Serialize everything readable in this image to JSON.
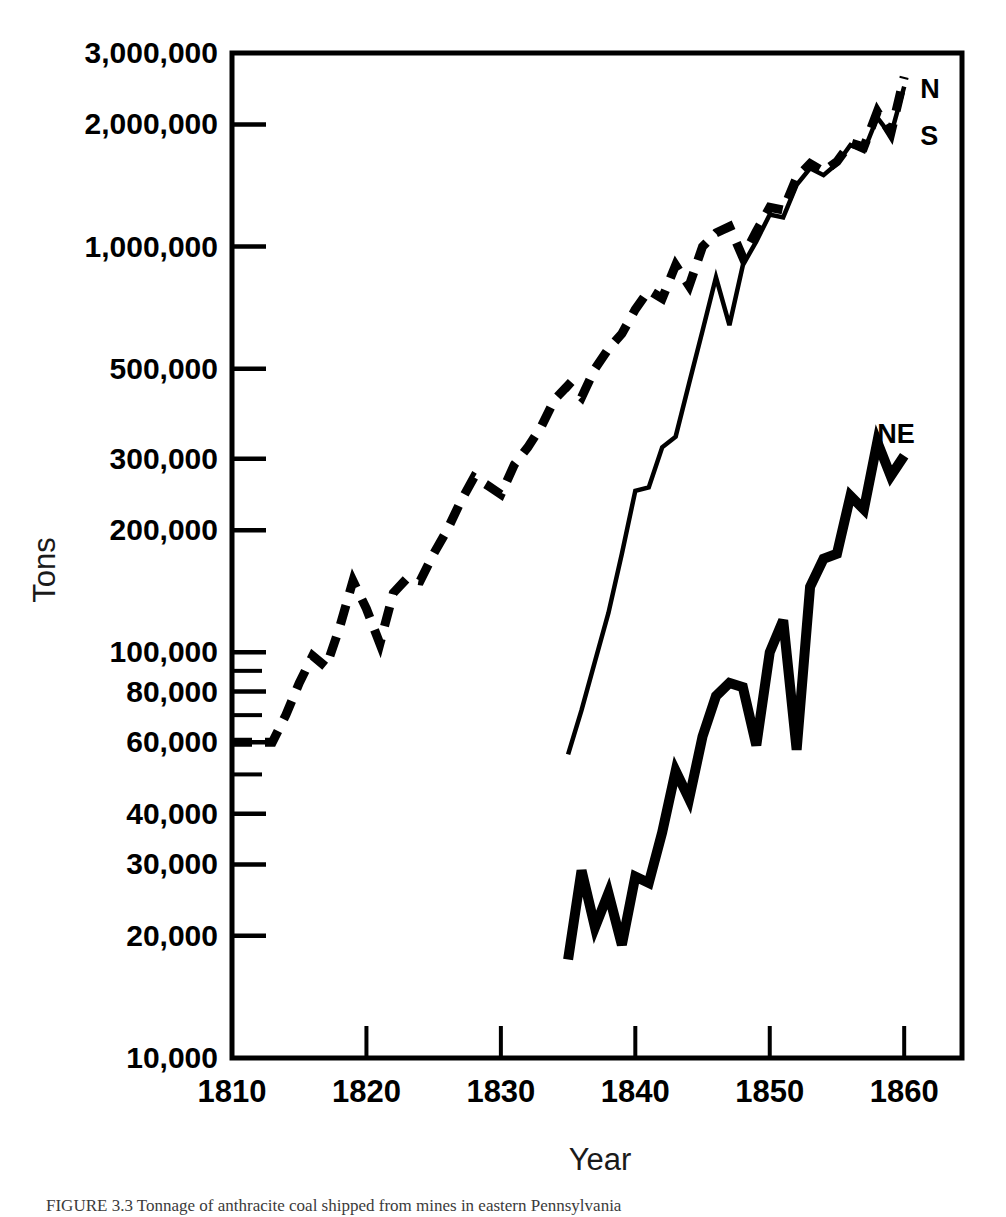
{
  "figure": {
    "caption": "FIGURE 3.3  Tonnage of anthracite coal shipped from mines in eastern Pennsylvania"
  },
  "chart_data": {
    "type": "line",
    "title": "",
    "xlabel": "Year",
    "ylabel": "Tons",
    "yscale": "log",
    "ylim": [
      10000,
      3000000
    ],
    "xlim": [
      1810,
      1864.3
    ],
    "grid": false,
    "legend_position": "inline-right",
    "ytick_labels": [
      "3,000,000",
      "2,000,000",
      "1,000,000",
      "500,000",
      "300,000",
      "200,000",
      "100,000",
      "80,000",
      "60,000",
      "40,000",
      "30,000",
      "20,000",
      "10,000"
    ],
    "ytick_values": [
      3000000,
      2000000,
      1000000,
      500000,
      300000,
      200000,
      100000,
      80000,
      60000,
      40000,
      30000,
      20000,
      10000
    ],
    "ytick_minor_values": [
      90000,
      70000,
      50000
    ],
    "xtick_labels": [
      "1810",
      "1820",
      "1830",
      "1840",
      "1850",
      "1860"
    ],
    "xtick_values": [
      1810,
      1820,
      1830,
      1840,
      1850,
      1860
    ],
    "series": [
      {
        "name": "N",
        "label": "N",
        "style": "dashed",
        "label_x": 1861.2,
        "label_y": 2450000,
        "x": [
          1810,
          1811,
          1812,
          1813,
          1814,
          1815,
          1816,
          1817,
          1818,
          1819,
          1820,
          1821,
          1822,
          1823,
          1824,
          1825,
          1826,
          1827,
          1828,
          1829,
          1830,
          1831,
          1832,
          1833,
          1834,
          1835,
          1836,
          1837,
          1838,
          1839,
          1840,
          1841,
          1842,
          1843,
          1844,
          1845,
          1846,
          1847,
          1848,
          1849,
          1850,
          1851,
          1852,
          1853,
          1854,
          1855,
          1856,
          1857,
          1858,
          1859,
          1860
        ],
        "y": [
          60000,
          60000,
          60000,
          60000,
          70000,
          84000,
          98000,
          92000,
          115000,
          150000,
          128000,
          105000,
          140000,
          152000,
          150000,
          175000,
          200000,
          235000,
          270000,
          258000,
          245000,
          290000,
          320000,
          360000,
          420000,
          455000,
          425000,
          500000,
          560000,
          610000,
          700000,
          780000,
          745000,
          900000,
          800000,
          1000000,
          1080000,
          1120000,
          940000,
          1090000,
          1250000,
          1230000,
          1480000,
          1600000,
          1530000,
          1620000,
          1800000,
          1760000,
          2150000,
          1900000,
          2620000
        ]
      },
      {
        "name": "S",
        "label": "S",
        "style": "solid-thin",
        "label_x": 1861.2,
        "label_y": 1870000,
        "x": [
          1835,
          1836,
          1837,
          1838,
          1839,
          1840,
          1841,
          1842,
          1843,
          1844,
          1845,
          1846,
          1847,
          1848,
          1849,
          1850,
          1851,
          1852,
          1853,
          1854,
          1855,
          1856,
          1857,
          1858,
          1859,
          1860
        ],
        "y": [
          56000,
          72000,
          95000,
          125000,
          175000,
          250000,
          255000,
          320000,
          340000,
          460000,
          620000,
          840000,
          640000,
          900000,
          1030000,
          1200000,
          1180000,
          1420000,
          1560000,
          1500000,
          1600000,
          1780000,
          1720000,
          2080000,
          1880000,
          2480000
        ]
      },
      {
        "name": "NE",
        "label": "NE",
        "style": "solid-thick",
        "label_x": 1858.0,
        "label_y": 345000,
        "x": [
          1835,
          1836,
          1837,
          1838,
          1839,
          1840,
          1841,
          1842,
          1843,
          1844,
          1845,
          1846,
          1847,
          1848,
          1849,
          1850,
          1851,
          1852,
          1853,
          1854,
          1855,
          1856,
          1857,
          1858,
          1859,
          1860
        ],
        "y": [
          17500,
          29000,
          21000,
          25500,
          19000,
          28000,
          27000,
          36000,
          51000,
          43500,
          62000,
          78000,
          84000,
          82000,
          59000,
          100000,
          120000,
          57500,
          145000,
          170000,
          175000,
          243000,
          225000,
          330000,
          272000,
          305000
        ]
      }
    ]
  }
}
